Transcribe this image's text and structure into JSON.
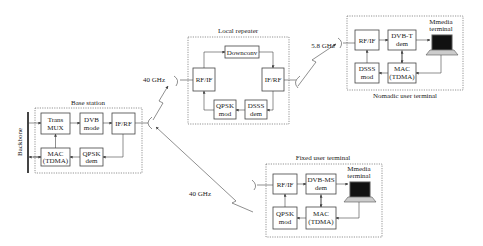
{
  "diagram": {
    "groups": {
      "base_station": "Base station",
      "local_repeater": "Local repeater",
      "nomadic": "Nomadic user terminal",
      "fixed": "Fixed user terminal"
    },
    "backbone": "Backbone",
    "links": {
      "bs_to_rep": "40 GHz",
      "bs_to_fixed": "40 GHz",
      "rep_to_nomadic": "5.8 GHz"
    },
    "base_station": {
      "trans_mux": [
        "Trans",
        "MUX"
      ],
      "dvb_mode": [
        "DVB",
        "mode"
      ],
      "if_rf": [
        "IF/RF"
      ],
      "mac": [
        "MAC",
        "(TDMA)"
      ],
      "qpsk_dem": [
        "QPSK",
        "dem"
      ]
    },
    "repeater": {
      "downconv": [
        "Downconv"
      ],
      "rf_if": [
        "RF/IF"
      ],
      "if_rf": [
        "IF/RF"
      ],
      "qpsk_mod": [
        "QPSK",
        "mod"
      ],
      "dsss_dem": [
        "DSSS",
        "dem"
      ]
    },
    "nomadic": {
      "rf_if": [
        "RF/IF"
      ],
      "dvbt_dem": [
        "DVB-T",
        "dem"
      ],
      "dsss_mod": [
        "DSSS",
        "mod"
      ],
      "mac": [
        "MAC",
        "(TDMA)"
      ],
      "terminal": [
        "Mmedia",
        "terminal"
      ]
    },
    "fixed": {
      "rf_if": [
        "RF/IF"
      ],
      "dvbms_dem": [
        "DVB-MS",
        "dem"
      ],
      "qpsk_mod": [
        "QPSK",
        "mod"
      ],
      "mac": [
        "MAC",
        "(TDMA)"
      ],
      "terminal": [
        "Mmedia",
        "terminal"
      ]
    }
  }
}
